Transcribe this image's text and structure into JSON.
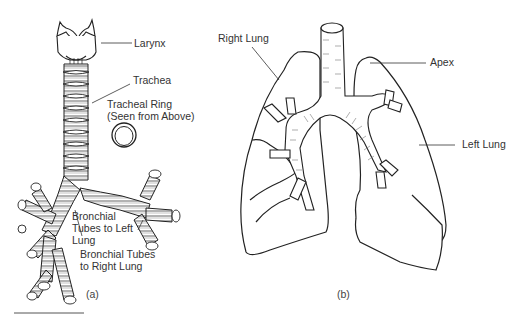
{
  "panel_a": {
    "caption": "(a)",
    "labels": {
      "larynx": "Larynx",
      "trachea": "Trachea",
      "tracheal_ring": "Tracheal Ring\n(Seen from Above)",
      "bronchial_left": "Bronchial\nTubes to Left\nLung",
      "bronchial_right": "Bronchial Tubes\nto Right Lung"
    }
  },
  "panel_b": {
    "caption": "(b)",
    "labels": {
      "right_lung": "Right Lung",
      "apex": "Apex",
      "left_lung": "Left Lung"
    }
  }
}
